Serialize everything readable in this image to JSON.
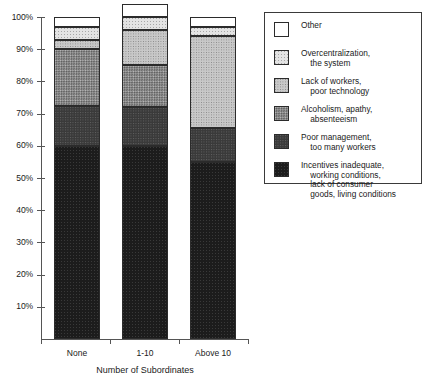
{
  "chart_data": {
    "type": "bar",
    "subtype": "stacked-percentage-column",
    "title": "",
    "xlabel": "Number of Subordinates",
    "ylabel": "",
    "categories": [
      "None",
      "1-10",
      "Above 10"
    ],
    "ylim": [
      0,
      100
    ],
    "yticks": [
      "10%",
      "20%",
      "30%",
      "40%",
      "50%",
      "60%",
      "70%",
      "80%",
      "90%",
      "100%"
    ],
    "ytick_values": [
      10,
      20,
      30,
      40,
      50,
      60,
      70,
      80,
      90,
      100
    ],
    "grid": false,
    "legend_position": "right",
    "value_unit": "%",
    "series": [
      {
        "name": "Incentives inadequate, working conditions, lack of consumer goods, living conditions",
        "legend_lines": [
          "Incentives inadequate,",
          "    working conditions,",
          "    lack of consumer",
          "    goods, living conditions"
        ],
        "fill": "f-incentives",
        "color": "#1c1c1c",
        "values": [
          60,
          60,
          55
        ]
      },
      {
        "name": "Poor management, too many workers",
        "legend_lines": [
          "Poor management,",
          "    too many workers"
        ],
        "fill": "f-poormgmt",
        "color": "#3a3a3a",
        "values": [
          12.5,
          12,
          10.5
        ]
      },
      {
        "name": "Alcoholism, apathy, absenteeism",
        "legend_lines": [
          "Alcoholism, apathy,",
          "    absenteeism"
        ],
        "fill": "f-alcohol",
        "color": "#8f8f8f",
        "values": [
          17.5,
          13,
          0
        ]
      },
      {
        "name": "Lack of workers, poor technology",
        "legend_lines": [
          "Lack of workers,",
          "    poor technology"
        ],
        "fill": "f-lack",
        "color": "#c8c8c8",
        "values": [
          3,
          11,
          28.5
        ]
      },
      {
        "name": "Overcentralization, the system",
        "legend_lines": [
          "Overcentralization,",
          "    the system"
        ],
        "fill": "f-overcentral",
        "color": "#e3e3e3",
        "values": [
          4,
          4,
          3
        ]
      },
      {
        "name": "Other",
        "legend_lines": [
          "Other"
        ],
        "fill": "f-other",
        "color": "#ffffff",
        "values": [
          3,
          4,
          3
        ]
      }
    ]
  }
}
